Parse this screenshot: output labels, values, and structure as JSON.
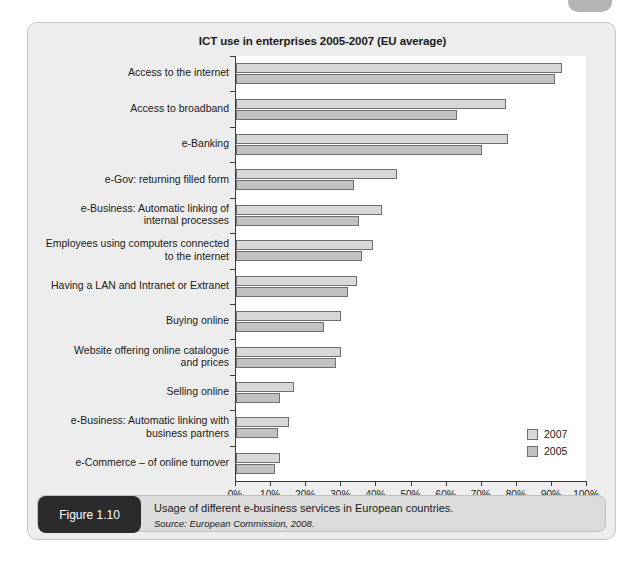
{
  "figure": {
    "badge_label": "Figure 1.10",
    "caption": "Usage of different e-business services in European countries.",
    "source": "Source: European Commission, 2008."
  },
  "chart_data": {
    "type": "bar",
    "orientation": "horizontal",
    "title": "ICT use in enterprises 2005-2007 (EU average)",
    "xlabel": "",
    "ylabel": "",
    "xlim": [
      0,
      100
    ],
    "xticks": [
      "0%",
      "10%",
      "20%",
      "30%",
      "40%",
      "50%",
      "60%",
      "70%",
      "80%",
      "90%",
      "100%"
    ],
    "xtick_values": [
      0,
      10,
      20,
      30,
      40,
      50,
      60,
      70,
      80,
      90,
      100
    ],
    "grid": false,
    "legend_position": "inside-bottom-right",
    "categories": [
      "Access to the internet",
      "Access to broadband",
      "e-Banking",
      "e-Gov: returning filled form",
      "e-Business: Automatic linking of\ninternal processes",
      "Employees using computers connected\nto the internet",
      "Having a LAN and Intranet or Extranet",
      "Buying online",
      "Website offering online catalogue\nand prices",
      "Selling online",
      "e-Business: Automatic linking with\nbusiness partners",
      "e-Commerce – of online turnover"
    ],
    "series": [
      {
        "name": "2007",
        "color": "#d8d8d8",
        "values": [
          93,
          77,
          77.5,
          46,
          41.5,
          39,
          34.5,
          30,
          30,
          16.5,
          15,
          12.5
        ]
      },
      {
        "name": "2005",
        "color": "#c2c2c2",
        "values": [
          91,
          63,
          70,
          33.5,
          35,
          36,
          32,
          25,
          28.5,
          12.5,
          12,
          11
        ]
      }
    ]
  }
}
